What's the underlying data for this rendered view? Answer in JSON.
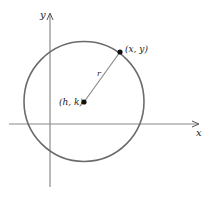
{
  "diagram": {
    "type": "circle-on-coordinate-plane",
    "axes": {
      "x_label": "x",
      "y_label": "y"
    },
    "circle": {
      "center_label": "(h, k)",
      "point_label": "(x, y)",
      "radius_label": "r"
    },
    "colors": {
      "axis": "#8a8a8a",
      "circle": "#6b6b6b",
      "radius": "#8a8a8a",
      "point": "#111111",
      "text": "#222222"
    }
  }
}
